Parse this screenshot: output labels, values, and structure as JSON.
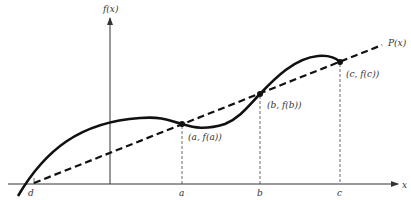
{
  "diagram": {
    "axis_labels": {
      "y": "f(x)",
      "x": "x"
    },
    "line_label": "P(x)",
    "x_ticks": [
      "d",
      "a",
      "b",
      "c"
    ],
    "points": [
      {
        "id": "a",
        "label": "(a, f(a))"
      },
      {
        "id": "b",
        "label": "(b, f(b))"
      },
      {
        "id": "c",
        "label": "(c, f(c))"
      }
    ],
    "colors": {
      "curve": "#111111",
      "axes": "#333333",
      "dashed": "#111111"
    }
  }
}
